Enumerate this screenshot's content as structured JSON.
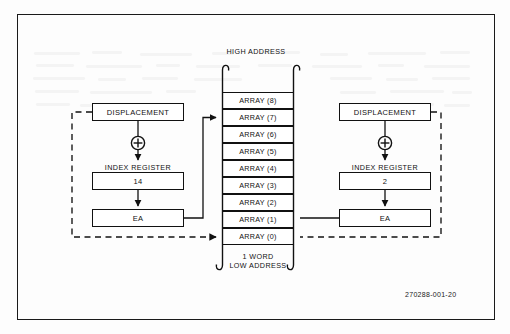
{
  "figure": {
    "id_label": "270288-001-20",
    "top_label": "HIGH ADDRESS",
    "bottom_label_1": "1 WORD",
    "bottom_label_2": "LOW ADDRESS"
  },
  "memory_array": {
    "cells": [
      {
        "label": "ARRAY (8)"
      },
      {
        "label": "ARRAY (7)"
      },
      {
        "label": "ARRAY (6)"
      },
      {
        "label": "ARRAY (5)"
      },
      {
        "label": "ARRAY (4)"
      },
      {
        "label": "ARRAY (3)"
      },
      {
        "label": "ARRAY (2)"
      },
      {
        "label": "ARRAY (1)"
      },
      {
        "label": "ARRAY (0)"
      }
    ]
  },
  "left_group": {
    "displacement_label": "DISPLACEMENT",
    "operator": "plus-circle",
    "index_register_caption": "INDEX REGISTER",
    "index_register_value": "14",
    "ea_label": "EA"
  },
  "right_group": {
    "displacement_label": "DISPLACEMENT",
    "operator": "plus-circle",
    "index_register_caption": "INDEX REGISTER",
    "index_register_value": "2",
    "ea_label": "EA"
  },
  "colors": {
    "ink": "#111111",
    "paper": "#fdfdfd"
  }
}
